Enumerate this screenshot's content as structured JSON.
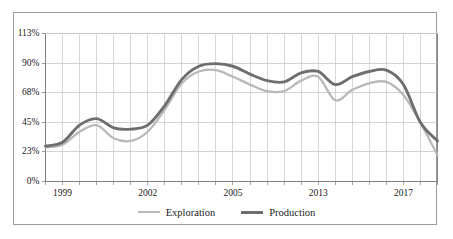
{
  "chart_data": {
    "type": "line",
    "title": "",
    "subtitle": "",
    "xlabel": "",
    "ylabel": "",
    "ylim": [
      0,
      113
    ],
    "ytick_labels": [
      "0%",
      "23%",
      "45%",
      "68%",
      "90%",
      "113%"
    ],
    "ytick_values": [
      0,
      23,
      45,
      68,
      90,
      113
    ],
    "xtick_labels": [
      "1999",
      "2002",
      "2005",
      "2013",
      "2017"
    ],
    "xtick_values": [
      1,
      6,
      11,
      16,
      21
    ],
    "grid": true,
    "grid_x": true,
    "grid_y": true,
    "legend_position": "bottom",
    "x": [
      0,
      1,
      2,
      3,
      4,
      5,
      6,
      7,
      8,
      9,
      10,
      11,
      12,
      13,
      14,
      15,
      16,
      17,
      18,
      19,
      20,
      21,
      22,
      23
    ],
    "series": [
      {
        "name": "Exploration",
        "color": "#b9b9b9",
        "values": [
          26,
          28,
          38,
          43,
          33,
          31,
          38,
          55,
          75,
          84,
          85,
          80,
          74,
          69,
          69,
          77,
          80,
          62,
          70,
          75,
          76,
          66,
          45,
          20
        ]
      },
      {
        "name": "Production",
        "color": "#6e6e6e",
        "values": [
          27,
          30,
          43,
          48,
          41,
          40,
          43,
          58,
          78,
          88,
          90,
          88,
          82,
          77,
          76,
          83,
          84,
          74,
          80,
          84,
          85,
          74,
          45,
          31
        ]
      }
    ],
    "legend": [
      {
        "label": "Exploration",
        "color": "#b9b9b9"
      },
      {
        "label": "Production",
        "color": "#6e6e6e"
      }
    ],
    "colors": {
      "exploration": "#b9b9b9",
      "production": "#6e6e6e",
      "grid": "#c8c8c8",
      "axis": "#808080",
      "frame": "#9a9a9a",
      "text": "#1a1a1a",
      "background": "#ffffff"
    }
  }
}
